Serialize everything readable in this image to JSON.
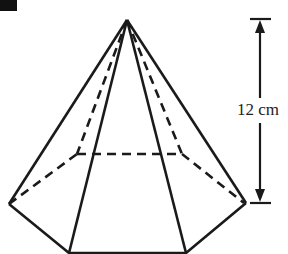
{
  "figure": {
    "type": "hexagonal pyramid",
    "height_label": "12 cm",
    "colors": {
      "line": "#1a1a1a",
      "background": "#ffffff"
    }
  }
}
